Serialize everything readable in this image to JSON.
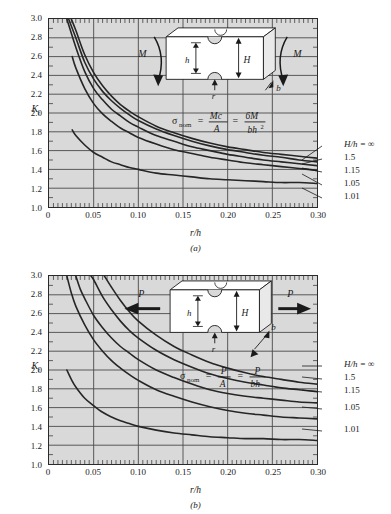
{
  "figure": {
    "background_color": "#ffffff",
    "plot_background_color": "#d9d9d9",
    "curve_color": "#262626",
    "grid_color": "#4a4a4a"
  },
  "panels": [
    {
      "caption": "(a)",
      "loading": "bending",
      "load_symbol": "M",
      "formula": {
        "lhs": "σ",
        "lhs_sub": "nom",
        "eq1_num": "Mc",
        "eq1_den": "A",
        "eq2_num": "6M",
        "eq2_den": "bh",
        "eq2_den_exp": "2"
      },
      "diagram": {
        "dim_small": "h",
        "dim_large": "H",
        "radius": "r",
        "thickness": "b"
      },
      "chart_data": {
        "type": "line",
        "title": "Stress-concentration factor K_t for a notched rectangular bar in bending",
        "xlabel": "r/h",
        "ylabel": "K_t",
        "xlim": [
          0,
          0.3
        ],
        "ylim": [
          1.0,
          3.0
        ],
        "xticks": [
          0,
          0.05,
          0.1,
          0.15,
          0.2,
          0.25,
          0.3
        ],
        "xticklabels": [
          "0",
          "0.05",
          "0.10",
          "0.15",
          "0.20",
          "0.25",
          "0.30"
        ],
        "yticks": [
          1.0,
          1.2,
          1.4,
          1.6,
          1.8,
          2.0,
          2.2,
          2.4,
          2.6,
          2.8,
          3.0
        ],
        "yticklabels": [
          "1.0",
          "1.2",
          "1.4",
          "1.6",
          "1.8",
          "2.0",
          "2.2",
          "2.4",
          "2.6",
          "2.8",
          "3.0"
        ],
        "grid": true,
        "legend_position": "right-outside",
        "legend_title": "H/h = ",
        "series": [
          {
            "name": "H/h = ∞",
            "label": "H/h = ∞",
            "x": [
              0.025,
              0.03,
              0.04,
              0.05,
              0.06,
              0.07,
              0.08,
              0.09,
              0.1,
              0.12,
              0.14,
              0.16,
              0.18,
              0.2,
              0.22,
              0.24,
              0.26,
              0.28,
              0.3
            ],
            "y": [
              3.0,
              2.88,
              2.62,
              2.43,
              2.29,
              2.18,
              2.09,
              2.02,
              1.96,
              1.86,
              1.79,
              1.73,
              1.68,
              1.64,
              1.61,
              1.58,
              1.56,
              1.54,
              1.52
            ]
          },
          {
            "name": "H/h = 1.5",
            "label": "1.5",
            "x": [
              0.022,
              0.03,
              0.04,
              0.05,
              0.06,
              0.07,
              0.08,
              0.09,
              0.1,
              0.12,
              0.14,
              0.16,
              0.18,
              0.2,
              0.22,
              0.24,
              0.26,
              0.28,
              0.3
            ],
            "y": [
              3.0,
              2.8,
              2.54,
              2.36,
              2.23,
              2.13,
              2.05,
              1.98,
              1.92,
              1.83,
              1.76,
              1.7,
              1.65,
              1.61,
              1.58,
              1.55,
              1.53,
              1.5,
              1.48
            ]
          },
          {
            "name": "H/h = 1.15",
            "label": "1.15",
            "x": [
              0.02,
              0.03,
              0.04,
              0.05,
              0.06,
              0.07,
              0.08,
              0.09,
              0.1,
              0.12,
              0.14,
              0.16,
              0.18,
              0.2,
              0.22,
              0.24,
              0.26,
              0.28,
              0.3
            ],
            "y": [
              3.0,
              2.7,
              2.44,
              2.26,
              2.14,
              2.04,
              1.97,
              1.9,
              1.85,
              1.76,
              1.7,
              1.64,
              1.6,
              1.56,
              1.53,
              1.5,
              1.48,
              1.46,
              1.44
            ]
          },
          {
            "name": "H/h = 1.05",
            "label": "1.05",
            "x": [
              0.026,
              0.03,
              0.04,
              0.05,
              0.06,
              0.07,
              0.08,
              0.09,
              0.1,
              0.12,
              0.14,
              0.16,
              0.18,
              0.2,
              0.22,
              0.24,
              0.26,
              0.28,
              0.3
            ],
            "y": [
              2.6,
              2.48,
              2.26,
              2.1,
              1.99,
              1.91,
              1.84,
              1.79,
              1.74,
              1.67,
              1.61,
              1.57,
              1.53,
              1.5,
              1.47,
              1.45,
              1.43,
              1.41,
              1.39
            ]
          },
          {
            "name": "H/h = 1.01",
            "label": "1.01",
            "x": [
              0.026,
              0.03,
              0.04,
              0.05,
              0.06,
              0.07,
              0.08,
              0.09,
              0.1,
              0.12,
              0.14,
              0.16,
              0.18,
              0.2,
              0.22,
              0.24,
              0.26,
              0.28,
              0.3
            ],
            "y": [
              1.82,
              1.76,
              1.66,
              1.58,
              1.53,
              1.48,
              1.45,
              1.42,
              1.4,
              1.36,
              1.34,
              1.32,
              1.3,
              1.29,
              1.28,
              1.27,
              1.26,
              1.26,
              1.25
            ]
          }
        ]
      }
    },
    {
      "caption": "(b)",
      "loading": "axial tension",
      "load_symbol": "P",
      "formula": {
        "lhs": "σ",
        "lhs_sub": "nom",
        "eq1_num": "P",
        "eq1_den": "A",
        "eq2_num": "P",
        "eq2_den": "bh",
        "eq2_den_exp": ""
      },
      "diagram": {
        "dim_small": "h",
        "dim_large": "H",
        "radius": "r",
        "thickness": "b"
      },
      "chart_data": {
        "type": "line",
        "title": "Stress-concentration factor K_t for a notched rectangular bar in tension",
        "xlabel": "r/h",
        "ylabel": "K_t",
        "xlim": [
          0,
          0.3
        ],
        "ylim": [
          1.0,
          3.0
        ],
        "xticks": [
          0,
          0.05,
          0.1,
          0.15,
          0.2,
          0.25,
          0.3
        ],
        "xticklabels": [
          "0",
          "0.05",
          "0.10",
          "0.15",
          "0.20",
          "0.25",
          "0.30"
        ],
        "yticks": [
          1.0,
          1.2,
          1.4,
          1.6,
          1.8,
          2.0,
          2.2,
          2.4,
          2.6,
          2.8,
          3.0
        ],
        "yticklabels": [
          "1.0",
          "1.2",
          "1.4",
          "1.6",
          "1.8",
          "2.0",
          "2.2",
          "2.4",
          "2.6",
          "2.8",
          "3.0"
        ],
        "grid": true,
        "legend_position": "right-outside",
        "legend_title": "H/h = ",
        "series": [
          {
            "name": "H/h = ∞",
            "label": "H/h = ∞",
            "x": [
              0.062,
              0.07,
              0.08,
              0.09,
              0.1,
              0.12,
              0.14,
              0.16,
              0.18,
              0.2,
              0.22,
              0.24,
              0.26,
              0.28,
              0.3
            ],
            "y": [
              3.0,
              2.88,
              2.74,
              2.62,
              2.52,
              2.37,
              2.25,
              2.16,
              2.08,
              2.02,
              1.97,
              1.93,
              1.9,
              1.87,
              1.85
            ]
          },
          {
            "name": "H/h = 1.5",
            "label": "1.5",
            "x": [
              0.047,
              0.05,
              0.06,
              0.07,
              0.08,
              0.09,
              0.1,
              0.12,
              0.14,
              0.16,
              0.18,
              0.2,
              0.22,
              0.24,
              0.26,
              0.28,
              0.3
            ],
            "y": [
              3.0,
              2.96,
              2.78,
              2.64,
              2.52,
              2.42,
              2.34,
              2.21,
              2.11,
              2.03,
              1.96,
              1.91,
              1.87,
              1.84,
              1.81,
              1.79,
              1.77
            ]
          },
          {
            "name": "H/h = 1.15",
            "label": "1.15",
            "x": [
              0.03,
              0.035,
              0.04,
              0.05,
              0.06,
              0.07,
              0.08,
              0.09,
              0.1,
              0.12,
              0.14,
              0.16,
              0.18,
              0.2,
              0.22,
              0.24,
              0.26,
              0.28,
              0.3
            ],
            "y": [
              3.0,
              2.86,
              2.76,
              2.58,
              2.45,
              2.34,
              2.25,
              2.18,
              2.11,
              2.0,
              1.92,
              1.85,
              1.79,
              1.75,
              1.72,
              1.7,
              1.68,
              1.66,
              1.65
            ]
          },
          {
            "name": "H/h = 1.05",
            "label": "1.05",
            "x": [
              0.02,
              0.025,
              0.03,
              0.04,
              0.05,
              0.06,
              0.07,
              0.08,
              0.09,
              0.1,
              0.12,
              0.14,
              0.16,
              0.18,
              0.2,
              0.22,
              0.24,
              0.26,
              0.28,
              0.3
            ],
            "y": [
              3.0,
              2.82,
              2.68,
              2.48,
              2.32,
              2.2,
              2.1,
              2.02,
              1.95,
              1.89,
              1.79,
              1.72,
              1.66,
              1.61,
              1.57,
              1.54,
              1.52,
              1.5,
              1.49,
              1.48
            ]
          },
          {
            "name": "H/h = 1.01",
            "label": "1.01",
            "x": [
              0.02,
              0.025,
              0.03,
              0.04,
              0.05,
              0.06,
              0.07,
              0.08,
              0.09,
              0.1,
              0.12,
              0.14,
              0.16,
              0.18,
              0.2,
              0.22,
              0.24,
              0.26,
              0.28,
              0.3
            ],
            "y": [
              2.0,
              1.9,
              1.82,
              1.7,
              1.62,
              1.55,
              1.5,
              1.46,
              1.43,
              1.4,
              1.36,
              1.33,
              1.31,
              1.29,
              1.28,
              1.27,
              1.27,
              1.26,
              1.26,
              1.25
            ]
          }
        ]
      }
    }
  ]
}
